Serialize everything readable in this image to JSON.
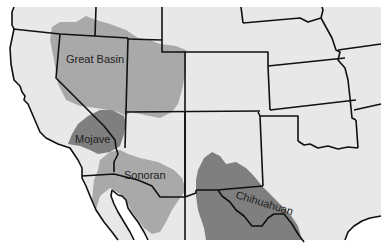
{
  "map": {
    "title": "North American Deserts of the Southwestern United States",
    "colors": {
      "background": "#ffffff",
      "land": "#e8e8e8",
      "great_basin": "#a9a9a9",
      "mojave": "#7f7f7f",
      "sonoran": "#a9a9a9",
      "chihuahuan": "#7f7f7f",
      "border": "#111111"
    },
    "regions": [
      {
        "id": "great_basin",
        "label": "Great Basin"
      },
      {
        "id": "mojave",
        "label": "Mojave"
      },
      {
        "id": "sonoran",
        "label": "Sonoran"
      },
      {
        "id": "chihuahuan",
        "label": "Chihuahuan"
      }
    ]
  }
}
